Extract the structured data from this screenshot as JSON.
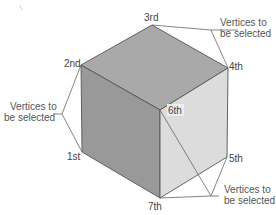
{
  "diagram": {
    "colors": {
      "background": "#ffffff",
      "top_face": "#a9a9a9",
      "left_face": "#999999",
      "right_face": "#dcdcdc",
      "edge": "#555555",
      "text": "#444444"
    },
    "vertices": [
      {
        "id": "1st",
        "label": "1st"
      },
      {
        "id": "2nd",
        "label": "2nd"
      },
      {
        "id": "3rd",
        "label": "3rd"
      },
      {
        "id": "4th",
        "label": "4th"
      },
      {
        "id": "5th",
        "label": "5th"
      },
      {
        "id": "6th",
        "label": "6th"
      },
      {
        "id": "7th",
        "label": "7th"
      }
    ],
    "callouts": [
      {
        "id": "top-right",
        "line1": "Vertices to",
        "line2": "be selected",
        "points_to": [
          "3rd",
          "4th"
        ]
      },
      {
        "id": "left",
        "line1": "Vertices to",
        "line2": "be selected",
        "points_to": [
          "2nd",
          "1st"
        ]
      },
      {
        "id": "bottom-right",
        "line1": "Vertices to",
        "line2": "be selected",
        "points_to": [
          "6th",
          "5th",
          "7th"
        ]
      }
    ]
  }
}
